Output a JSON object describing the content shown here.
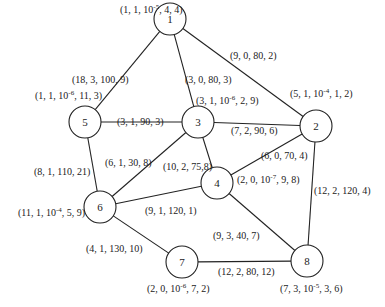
{
  "diagram": {
    "type": "network-graph",
    "nodes": [
      {
        "id": "1",
        "x": 170,
        "y": 19,
        "label": {
          "parts": [
            "(1, 1, 10",
            "-5",
            ", 4, 4)"
          ],
          "lx": 120,
          "ly": 4
        }
      },
      {
        "id": "2",
        "x": 316,
        "y": 126,
        "label": {
          "parts": [
            "(5, 1, 10",
            "-4",
            ", 1, 2)"
          ],
          "lx": 290,
          "ly": 88
        }
      },
      {
        "id": "3",
        "x": 198,
        "y": 122,
        "label": {
          "parts": [
            "(3, 1, 10",
            "-6",
            ", 2, 9)"
          ],
          "lx": 196,
          "ly": 95
        }
      },
      {
        "id": "4",
        "x": 217,
        "y": 183,
        "label": {
          "parts": [
            "(2, 0, 10",
            "-7",
            ", 9, 8)"
          ],
          "lx": 237,
          "ly": 174
        }
      },
      {
        "id": "5",
        "x": 85,
        "y": 122,
        "label": {
          "parts": [
            "(1, 1, 10",
            "-6",
            ", 11, 3)"
          ],
          "lx": 35,
          "ly": 90
        }
      },
      {
        "id": "6",
        "x": 100,
        "y": 207,
        "label": {
          "parts": [
            "(11, 1, 10",
            "-4",
            ", 5, 9)"
          ],
          "lx": 18,
          "ly": 207
        }
      },
      {
        "id": "7",
        "x": 182,
        "y": 262,
        "label": {
          "parts": [
            "(2, 0, 10",
            "-6",
            ", 7, 2)"
          ],
          "lx": 147,
          "ly": 283
        }
      },
      {
        "id": "8",
        "x": 307,
        "y": 261,
        "label": {
          "parts": [
            "(7, 3, 10",
            "-5",
            ", 3, 6)"
          ],
          "lx": 280,
          "ly": 283
        }
      }
    ],
    "edges": [
      {
        "from": "1",
        "to": "2",
        "label": "(9, 0, 80, 2)",
        "lx": 230,
        "ly": 50
      },
      {
        "from": "1",
        "to": "3",
        "label": "(3, 0, 80, 3)",
        "lx": 185,
        "ly": 74
      },
      {
        "from": "1",
        "to": "5",
        "label": "(18, 3, 100, 9)",
        "lx": 72,
        "ly": 74
      },
      {
        "from": "5",
        "to": "3",
        "label": "(3, 1, 90, 3)",
        "lx": 117,
        "ly": 116
      },
      {
        "from": "3",
        "to": "2",
        "label": "(7, 2, 90, 6)",
        "lx": 231,
        "ly": 125
      },
      {
        "from": "5",
        "to": "6",
        "label": "(8, 1, 110, 21)",
        "lx": 34,
        "ly": 166
      },
      {
        "from": "6",
        "to": "3",
        "label": "(6, 1, 30, 8)",
        "lx": 105,
        "ly": 157
      },
      {
        "from": "3",
        "to": "4",
        "label": "(10, 2, 75,8)",
        "lx": 163,
        "ly": 161
      },
      {
        "from": "4",
        "to": "2",
        "label": "(6, 0, 70, 4)",
        "lx": 261,
        "ly": 150
      },
      {
        "from": "6",
        "to": "4",
        "label": "(9, 1, 120, 1)",
        "lx": 145,
        "ly": 205
      },
      {
        "from": "2",
        "to": "8",
        "label": "(12, 2, 120, 4)",
        "lx": 314,
        "ly": 185
      },
      {
        "from": "4",
        "to": "8",
        "label": "(9, 3, 40, 7)",
        "lx": 213,
        "ly": 230
      },
      {
        "from": "6",
        "to": "7",
        "label": "(4, 1, 130, 10)",
        "lx": 86,
        "ly": 243
      },
      {
        "from": "7",
        "to": "8",
        "label": "(12, 2, 80, 12)",
        "lx": 218,
        "ly": 266
      }
    ],
    "node_radius": 16,
    "stroke_color": "#222222",
    "background": "#ffffff"
  }
}
